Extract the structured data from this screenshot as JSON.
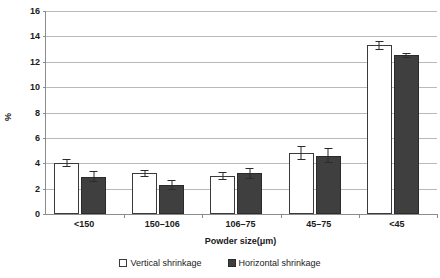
{
  "chart_data": {
    "type": "bar",
    "title": "",
    "xlabel": "Powder size(μm)",
    "ylabel": "%",
    "ylim": [
      0,
      16
    ],
    "ytick_step": 2,
    "yticks": [
      16,
      14,
      12,
      10,
      8,
      6,
      4,
      2,
      0
    ],
    "grid": true,
    "legend_position": "bottom-center",
    "categories": [
      "<150",
      "150–106",
      "106–75",
      "45–75",
      "<45"
    ],
    "series": [
      {
        "name": "Vertical shrinkage",
        "color": "#ffffff",
        "edge_color": "#3a3a3a",
        "values": [
          4.0,
          3.2,
          3.0,
          4.8,
          13.3
        ],
        "errors": [
          0.3,
          0.25,
          0.3,
          0.55,
          0.35
        ]
      },
      {
        "name": "Horizontal shrinkage",
        "color": "#3f3f3f",
        "edge_color": "#2b2b2b",
        "values": [
          2.95,
          2.3,
          3.2,
          4.6,
          12.5
        ],
        "errors": [
          0.45,
          0.4,
          0.45,
          0.6,
          0.2
        ]
      }
    ]
  },
  "legend": {
    "entries": [
      {
        "label": "Vertical shrinkage",
        "swatch": "open-square-icon"
      },
      {
        "label": "Horizontal shrinkage",
        "swatch": "filled-square-icon"
      }
    ]
  },
  "axes": {
    "y_title": "%",
    "x_title": "Powder size(μm)"
  },
  "colors": {
    "gridline": "#b9b9b9",
    "axis": "#8c8c8c",
    "text": "#1a1a1a",
    "bar_light": "#ffffff",
    "bar_dark": "#3f3f3f"
  }
}
